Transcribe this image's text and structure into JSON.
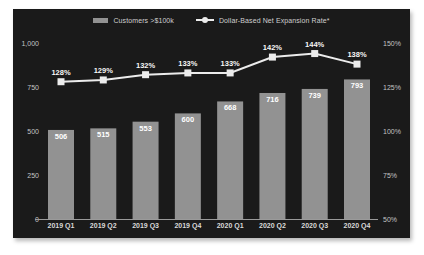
{
  "legend": {
    "bar_label": "Customers >$100k",
    "line_label": "Dollar-Based Net Expansion Rate*"
  },
  "colors": {
    "card_background": "#1a1a1a",
    "page_background": "#ffffff",
    "bar_fill": "#929292",
    "line_color": "#ececec",
    "marker_fill": "#ececec",
    "axis_label": "#c4c4c4",
    "x_label": "#d9d9d9",
    "value_label": "#ffffff",
    "axis_line": "#9a9a9a",
    "legend_text": "#cfcfcf"
  },
  "chart_data": {
    "type": "bar",
    "subtype": "bar-line-combo",
    "categories": [
      "2019 Q1",
      "2019 Q2",
      "2019 Q3",
      "2019 Q4",
      "2020 Q1",
      "2020 Q2",
      "2020 Q3",
      "2020 Q4"
    ],
    "series": [
      {
        "name": "Customers >$100k",
        "type": "bar",
        "axis": "left",
        "values": [
          506,
          515,
          553,
          600,
          668,
          716,
          739,
          793
        ],
        "data_labels": [
          "506",
          "515",
          "553",
          "600",
          "668",
          "716",
          "739",
          "793"
        ]
      },
      {
        "name": "Dollar-Based Net Expansion Rate*",
        "type": "line",
        "axis": "right",
        "marker": "square",
        "values": [
          128,
          129,
          132,
          133,
          133,
          142,
          144,
          138
        ],
        "data_labels": [
          "128%",
          "129%",
          "132%",
          "133%",
          "133%",
          "142%",
          "144%",
          "138%"
        ]
      }
    ],
    "left_axis": {
      "min": 0,
      "max": 1000,
      "tick_values": [
        1000,
        750,
        500,
        250,
        0
      ],
      "tick_labels": [
        "1,000",
        "750",
        "500",
        "250",
        "0"
      ]
    },
    "right_axis": {
      "min": 50,
      "max": 150,
      "tick_values": [
        150,
        125,
        100,
        75,
        50
      ],
      "tick_labels": [
        "150%",
        "125%",
        "100%",
        "75%",
        "50%"
      ]
    },
    "title": "",
    "xlabel": "",
    "ylabel": "",
    "grid": false,
    "legend_position": "top",
    "theme": "dark"
  }
}
